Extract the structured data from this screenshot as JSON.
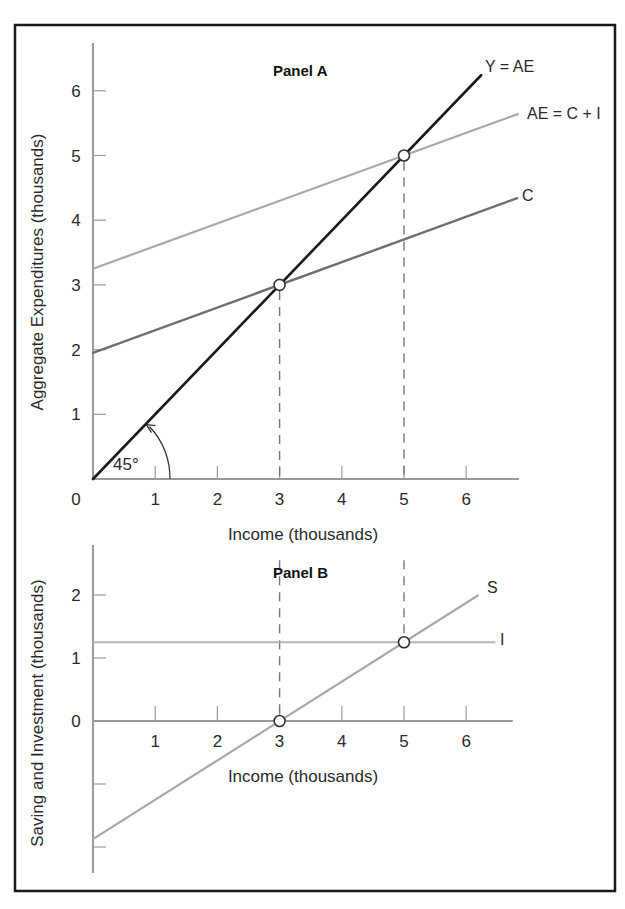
{
  "chart_data": [
    {
      "type": "line",
      "panel": "Panel A",
      "title": "Panel A",
      "xlabel": "Income (thousands)",
      "ylabel": "Aggregate Expenditures (thousands)",
      "x_ticks": [
        0,
        1,
        2,
        3,
        4,
        5,
        6
      ],
      "y_ticks": [
        1,
        2,
        3,
        4,
        5,
        6
      ],
      "xlim": [
        0,
        6.85
      ],
      "ylim": [
        0,
        6.9
      ],
      "grid": false,
      "legend_position": "inline labels at line ends",
      "series": [
        {
          "name": "Y = AE",
          "color": "#1a1a1a",
          "width": 2.6,
          "points": [
            [
              0,
              0
            ],
            [
              6.24,
              6.24
            ]
          ]
        },
        {
          "name": "AE = C + I",
          "color": "#a8a8a8",
          "width": 2.2,
          "points": [
            [
              0,
              3.25
            ],
            [
              6.83,
              5.64
            ]
          ]
        },
        {
          "name": "C",
          "color": "#6e6e6e",
          "width": 2.4,
          "points": [
            [
              0,
              1.95
            ],
            [
              6.82,
              4.34
            ]
          ]
        }
      ],
      "annotations": [
        {
          "type": "point",
          "x": 3,
          "y": 3,
          "label": "C = Y"
        },
        {
          "type": "point",
          "x": 5,
          "y": 5,
          "label": "AE = Y equilibrium"
        },
        {
          "type": "dashed_vline",
          "x": 3,
          "from": 0,
          "to": 3
        },
        {
          "type": "dashed_vline",
          "x": 5,
          "from": 0,
          "to": 5
        },
        {
          "type": "angle",
          "text": "45°"
        }
      ]
    },
    {
      "type": "line",
      "panel": "Panel B",
      "title": "Panel B",
      "xlabel": "Income (thousands)",
      "ylabel": "Saving and Investment (thousands)",
      "x_ticks": [
        1,
        2,
        3,
        4,
        5,
        6
      ],
      "y_ticks": [
        -2,
        -1,
        0,
        1,
        2
      ],
      "y_tick_labels_shown": [
        "0",
        "1",
        "2"
      ],
      "xlim": [
        0,
        6.75
      ],
      "ylim": [
        -2.4,
        2.8
      ],
      "grid": false,
      "series": [
        {
          "name": "S",
          "color": "#a8a8a8",
          "width": 2.2,
          "points": [
            [
              0,
              -1.875
            ],
            [
              6.2,
              2.0
            ]
          ]
        },
        {
          "name": "I",
          "color": "#b4b4b4",
          "width": 2.0,
          "points": [
            [
              0,
              1.25
            ],
            [
              6.47,
              1.25
            ]
          ]
        }
      ],
      "annotations": [
        {
          "type": "point",
          "x": 3,
          "y": 0
        },
        {
          "type": "point",
          "x": 5,
          "y": 1.25
        },
        {
          "type": "dashed_vline",
          "x": 3,
          "from": 2.55,
          "to": 0
        },
        {
          "type": "dashed_vline",
          "x": 5,
          "from": 2.55,
          "to": 1.25
        }
      ]
    }
  ],
  "figure": {
    "panel_a": {
      "title": "Panel A",
      "xlabel": "Income (thousands)",
      "ylabel": "Aggregate Expenditures (thousands)",
      "origin_label": "0",
      "angle_label": "45°",
      "labels": {
        "y_ae": "Y = AE",
        "ae": "AE = C + I",
        "c": "C"
      }
    },
    "panel_b": {
      "title": "Panel B",
      "xlabel": "Income (thousands)",
      "ylabel": "Saving and Investment (thousands)",
      "labels": {
        "s": "S",
        "i": "I"
      }
    },
    "colors": {
      "frame": "#1a1a1a",
      "axis": "#9a9a9a",
      "dashed": "#777777",
      "y_ae": "#1a1a1a",
      "ae": "#a8a8a8",
      "c": "#6e6e6e",
      "s": "#a8a8a8",
      "i": "#b4b4b4"
    }
  }
}
